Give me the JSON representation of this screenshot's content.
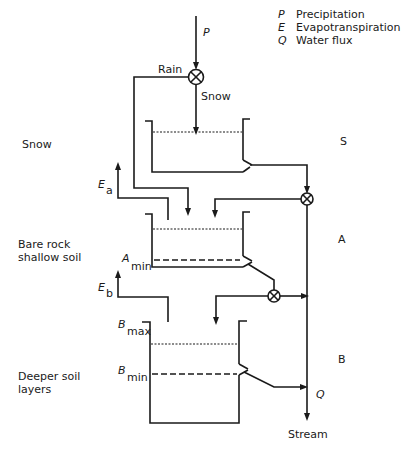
{
  "legend": {
    "items": [
      {
        "symbol": "P",
        "label": "Precipitation"
      },
      {
        "symbol": "E",
        "label": "Evapotranspiration"
      },
      {
        "symbol": "Q",
        "label": "Water flux"
      }
    ]
  },
  "inputs": {
    "precipitation": "P",
    "rain": "Rain",
    "snow": "Snow"
  },
  "layers": {
    "snow": {
      "left_label": "Snow",
      "right_label": "S"
    },
    "upper": {
      "left_label_line1": "Bare rock",
      "left_label_line2": "shallow soil",
      "right_label": "A",
      "min_symbol": "A",
      "min_sub": "min",
      "evap_symbol": "E",
      "evap_sub": "a"
    },
    "lower": {
      "left_label_line1": "Deeper soil",
      "left_label_line2": "layers",
      "right_label": "B",
      "max_symbol": "B",
      "max_sub": "max",
      "min_symbol": "B",
      "min_sub": "min",
      "evap_symbol": "E",
      "evap_sub": "b"
    }
  },
  "outputs": {
    "flux": "Q",
    "stream": "Stream"
  },
  "colors": {
    "ink": "#1a1a1a",
    "background": "#ffffff"
  }
}
